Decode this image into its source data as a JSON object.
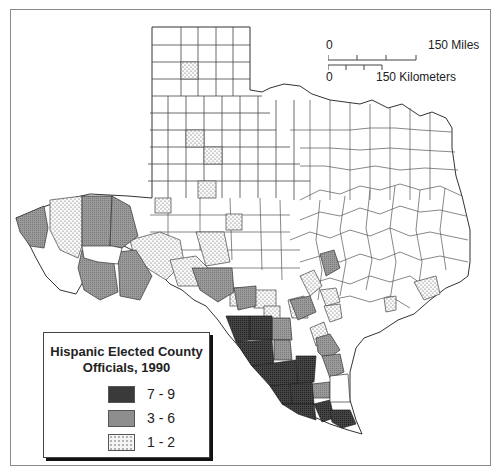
{
  "map": {
    "title": "Hispanic Elected County Officials, 1990",
    "title_line1": "Hispanic Elected County",
    "title_line2": "Officials, 1990",
    "region": "Texas counties"
  },
  "scale_bar": {
    "miles": {
      "start": "0",
      "end": "150 Miles"
    },
    "kilometers": {
      "start": "0",
      "end": "150 Kilometers"
    }
  },
  "legend": {
    "items": [
      {
        "label": "7 - 9",
        "fill": "#3a3a3a",
        "pattern": "dark-crosshatch"
      },
      {
        "label": "3 - 6",
        "fill": "#8e8e8e",
        "pattern": "medium-gray"
      },
      {
        "label": "1 - 2",
        "fill": "#f4f4f4",
        "pattern": "dotted"
      }
    ]
  },
  "colors": {
    "county_border": "#333333",
    "none": "#ffffff",
    "level_1_2": "#f2f2f2",
    "level_3_6": "#8e8e8e",
    "level_7_9": "#3a3a3a"
  }
}
